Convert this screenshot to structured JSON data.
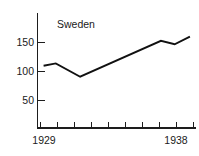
{
  "chart_data": {
    "type": "line",
    "title": "Sweden",
    "xlabel": "",
    "ylabel": "",
    "x": [
      1929,
      1930,
      1931,
      1932,
      1933,
      1934,
      1935,
      1936,
      1937,
      1938
    ],
    "categories": [
      "1929",
      "1930",
      "1931",
      "1932",
      "1933",
      "1934",
      "1935",
      "1936",
      "1937",
      "1938"
    ],
    "values": [
      110,
      114,
      103,
      91,
      101,
      113,
      125,
      138,
      153,
      147
    ],
    "series": [
      {
        "name": "Sweden",
        "values": [
          110,
          114,
          103,
          91,
          101,
          113,
          125,
          138,
          153,
          147
        ]
      }
    ],
    "line_vertices": [
      {
        "x": 1929.0,
        "y": 110
      },
      {
        "x": 1929.8,
        "y": 114
      },
      {
        "x": 1931.4,
        "y": 91
      },
      {
        "x": 1936.7,
        "y": 153
      },
      {
        "x": 1937.6,
        "y": 147
      },
      {
        "x": 1938.6,
        "y": 160
      }
    ],
    "ylim": [
      0,
      175
    ],
    "xlim": [
      1928.6,
      1939.0
    ],
    "yticks": [
      50,
      100,
      150
    ],
    "ytick_labels": [
      "50",
      "100",
      "150"
    ],
    "xticks": [
      1929,
      1930,
      1931,
      1932,
      1933,
      1934,
      1935,
      1936,
      1937,
      1938
    ],
    "xtick_labels_shown": [
      "1929",
      "1938"
    ],
    "grid": false,
    "legend": false,
    "line_color": "#111111",
    "axis_color": "#1d1d1d",
    "background_color": "#ffffff"
  },
  "axes": {
    "y_labels": [
      {
        "text": "150",
        "value": 150
      },
      {
        "text": "100",
        "value": 100
      },
      {
        "text": "50",
        "value": 50
      }
    ],
    "x_labels": [
      {
        "text": "1929",
        "value": 1929
      },
      {
        "text": "1938",
        "value": 1938
      }
    ]
  }
}
